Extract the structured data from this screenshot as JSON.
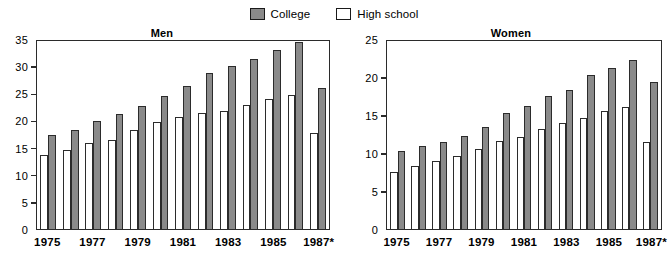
{
  "legend": {
    "items": [
      {
        "label": "College",
        "swatch": "college",
        "color": "#8a8a8a"
      },
      {
        "label": "High school",
        "swatch": "highschool",
        "color": "#ffffff"
      }
    ]
  },
  "chart_data": [
    {
      "type": "bar",
      "title": "Men",
      "xlabel": "",
      "ylabel": "",
      "ylim": [
        0,
        35
      ],
      "yticks": [
        0,
        5,
        10,
        15,
        20,
        25,
        30,
        35
      ],
      "grid": false,
      "legend_position": "top-center",
      "categories": [
        "1975",
        "1976",
        "1977",
        "1978",
        "1979",
        "1980",
        "1981",
        "1982",
        "1983",
        "1984",
        "1985",
        "1986",
        "1987*"
      ],
      "xtick_labels": [
        "1975",
        "1977",
        "1979",
        "1981",
        "1983",
        "1985",
        "1987*"
      ],
      "series": [
        {
          "name": "High school",
          "color": "#ffffff",
          "values": [
            13.6,
            14.5,
            15.8,
            16.4,
            18.2,
            19.7,
            20.7,
            21.4,
            21.7,
            22.9,
            24.0,
            24.7,
            17.6
          ]
        },
        {
          "name": "College",
          "color": "#8a8a8a",
          "values": [
            17.4,
            18.3,
            19.9,
            21.1,
            22.6,
            24.5,
            26.3,
            28.7,
            30.0,
            31.3,
            32.9,
            34.4,
            26.0
          ]
        }
      ]
    },
    {
      "type": "bar",
      "title": "Women",
      "xlabel": "",
      "ylabel": "",
      "ylim": [
        0,
        25
      ],
      "yticks": [
        0,
        5,
        10,
        15,
        20,
        25
      ],
      "grid": false,
      "legend_position": "top-center",
      "categories": [
        "1975",
        "1976",
        "1977",
        "1978",
        "1979",
        "1980",
        "1981",
        "1982",
        "1983",
        "1984",
        "1985",
        "1986",
        "1987*"
      ],
      "xtick_labels": [
        "1975",
        "1977",
        "1979",
        "1981",
        "1983",
        "1985",
        "1987*"
      ],
      "series": [
        {
          "name": "High school",
          "color": "#ffffff",
          "values": [
            7.5,
            8.3,
            9.0,
            9.6,
            10.5,
            11.6,
            12.1,
            13.2,
            13.9,
            14.6,
            15.5,
            16.0,
            11.5
          ]
        },
        {
          "name": "College",
          "color": "#8a8a8a",
          "values": [
            10.3,
            10.9,
            11.4,
            12.3,
            13.4,
            15.2,
            16.2,
            17.5,
            18.3,
            20.2,
            21.2,
            22.2,
            19.4
          ]
        }
      ]
    }
  ]
}
